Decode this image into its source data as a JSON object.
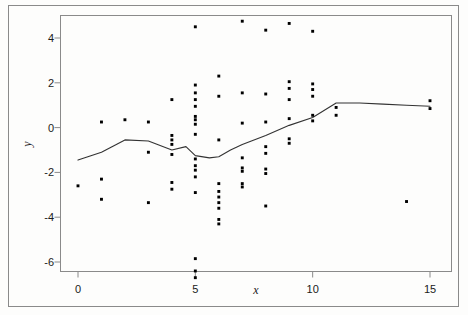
{
  "chart_data": {
    "type": "scatter",
    "title": "",
    "subtitle": "",
    "xlabel": "x",
    "ylabel": "y",
    "xlim": [
      -0.75,
      15.9
    ],
    "ylim": [
      -7.0,
      5.2
    ],
    "xticks": [
      0,
      5,
      10,
      15
    ],
    "xticklabels": [
      "0",
      "5",
      "10",
      "15"
    ],
    "yticks": [
      4,
      2,
      0,
      -2,
      -4,
      -6
    ],
    "yticklabels": [
      "4",
      "2",
      "0",
      "-2",
      "-4",
      "-6"
    ],
    "grid": false,
    "legend": null,
    "legend_position": "none",
    "point_color": "#000000",
    "line_color": "#333333",
    "frame_color": "#8a8a8a",
    "series": [
      {
        "name": "observations",
        "type": "scatter",
        "marker": "square",
        "points": [
          [
            0,
            -2.6
          ],
          [
            1,
            0.25
          ],
          [
            1,
            -2.3
          ],
          [
            1,
            -3.2
          ],
          [
            2,
            0.35
          ],
          [
            3,
            0.25
          ],
          [
            3,
            -1.1
          ],
          [
            3,
            -3.35
          ],
          [
            4,
            1.25
          ],
          [
            4,
            -0.35
          ],
          [
            4,
            -0.55
          ],
          [
            4,
            -0.75
          ],
          [
            4,
            -1.2
          ],
          [
            4,
            -2.45
          ],
          [
            4,
            -2.75
          ],
          [
            5,
            4.5
          ],
          [
            5,
            1.9
          ],
          [
            5,
            1.55
          ],
          [
            5,
            1.25
          ],
          [
            5,
            0.95
          ],
          [
            5,
            0.5
          ],
          [
            5,
            0.35
          ],
          [
            5,
            0.15
          ],
          [
            5,
            -0.3
          ],
          [
            5,
            -1.4
          ],
          [
            5,
            -1.7
          ],
          [
            5,
            -1.9
          ],
          [
            5,
            -2.2
          ],
          [
            5,
            -2.9
          ],
          [
            5,
            -5.85
          ],
          [
            5,
            -6.4
          ],
          [
            5,
            -6.7
          ],
          [
            6,
            2.3
          ],
          [
            6,
            1.4
          ],
          [
            6,
            -0.55
          ],
          [
            6,
            -2.5
          ],
          [
            6,
            -2.85
          ],
          [
            6,
            -3.1
          ],
          [
            6,
            -3.35
          ],
          [
            6,
            -3.6
          ],
          [
            6,
            -4.1
          ],
          [
            6,
            -4.3
          ],
          [
            7,
            4.75
          ],
          [
            7,
            1.55
          ],
          [
            7,
            0.2
          ],
          [
            7,
            -1.35
          ],
          [
            7,
            -1.8
          ],
          [
            7,
            -1.95
          ],
          [
            7,
            -2.5
          ],
          [
            7,
            -2.65
          ],
          [
            8,
            4.35
          ],
          [
            8,
            1.5
          ],
          [
            8,
            0.25
          ],
          [
            8,
            -0.85
          ],
          [
            8,
            -1.15
          ],
          [
            8,
            -1.85
          ],
          [
            8,
            -2.05
          ],
          [
            8,
            -3.5
          ],
          [
            9,
            4.65
          ],
          [
            9,
            2.05
          ],
          [
            9,
            1.75
          ],
          [
            9,
            1.25
          ],
          [
            9,
            0.4
          ],
          [
            9,
            -0.5
          ],
          [
            9,
            -0.7
          ],
          [
            10,
            4.3
          ],
          [
            10,
            1.95
          ],
          [
            10,
            1.7
          ],
          [
            10,
            1.4
          ],
          [
            10,
            0.55
          ],
          [
            10,
            0.3
          ],
          [
            11,
            0.9
          ],
          [
            11,
            0.55
          ],
          [
            14,
            -3.3
          ],
          [
            15,
            1.2
          ],
          [
            15,
            0.85
          ]
        ]
      },
      {
        "name": "smoothed-trend",
        "type": "line",
        "points": [
          [
            0,
            -1.45
          ],
          [
            1,
            -1.1
          ],
          [
            2,
            -0.55
          ],
          [
            3,
            -0.6
          ],
          [
            4,
            -1.0
          ],
          [
            4.6,
            -0.85
          ],
          [
            5,
            -1.25
          ],
          [
            5.6,
            -1.35
          ],
          [
            6,
            -1.3
          ],
          [
            6.5,
            -1.0
          ],
          [
            7,
            -0.75
          ],
          [
            8,
            -0.35
          ],
          [
            9,
            0.1
          ],
          [
            10,
            0.45
          ],
          [
            11,
            1.1
          ],
          [
            12,
            1.1
          ],
          [
            13,
            1.05
          ],
          [
            14,
            1.0
          ],
          [
            15,
            0.95
          ]
        ]
      }
    ]
  },
  "axes": {
    "x_label": "x",
    "y_label": "y",
    "x_tick_labels": [
      "0",
      "5",
      "10",
      "15"
    ],
    "y_tick_labels": [
      "4",
      "2",
      "0",
      "-2",
      "-4",
      "-6"
    ]
  }
}
